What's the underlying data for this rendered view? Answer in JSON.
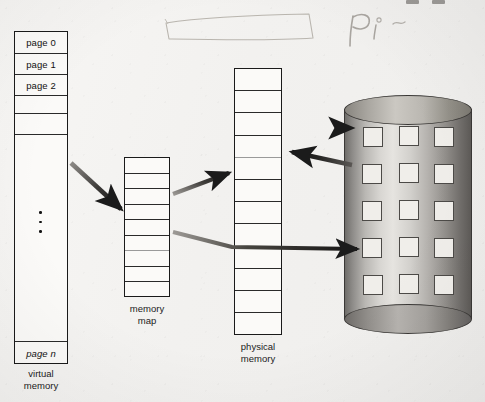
{
  "figure": {
    "background_color": "#f4f3f1",
    "ink_color": "#1a1a1a"
  },
  "virtual_memory": {
    "caption": "virtual\nmemory",
    "cells": [
      {
        "label": "page 0"
      },
      {
        "label": "page 1"
      },
      {
        "label": "page 2"
      },
      {
        "label": ""
      },
      {
        "label": ""
      },
      {
        "label": ""
      },
      {
        "label": "page n"
      }
    ],
    "ellipsis_dots": 3
  },
  "memory_map": {
    "caption": "memory\nmap",
    "cell_count": 9,
    "cells": [
      {
        "label": ""
      },
      {
        "label": ""
      },
      {
        "label": ""
      },
      {
        "label": ""
      },
      {
        "label": ""
      },
      {
        "label": ""
      },
      {
        "label": ""
      },
      {
        "label": ""
      },
      {
        "label": ""
      }
    ]
  },
  "physical_memory": {
    "caption": "physical\nmemory",
    "cell_count": 12,
    "cells": [
      {
        "label": ""
      },
      {
        "label": ""
      },
      {
        "label": ""
      },
      {
        "label": ""
      },
      {
        "label": ""
      },
      {
        "label": ""
      },
      {
        "label": ""
      },
      {
        "label": ""
      },
      {
        "label": ""
      },
      {
        "label": ""
      },
      {
        "label": ""
      },
      {
        "label": ""
      }
    ]
  },
  "disk": {
    "caption": "",
    "slot_rows": 5,
    "slot_columns": 3,
    "slot_color": "#f0eeea",
    "body_shade_color": "#8e8c89"
  },
  "arrows": [
    {
      "name": "virtual-memory-to-memory-map",
      "from": "virtual memory",
      "to": "memory map",
      "direction": "right-down"
    },
    {
      "name": "memory-map-to-physical-memory",
      "from": "memory map",
      "to": "physical memory",
      "direction": "right-up"
    },
    {
      "name": "memory-map-to-disk",
      "from": "memory map",
      "to": "disk",
      "direction": "right"
    },
    {
      "name": "physical-memory-to-disk",
      "from": "physical memory",
      "to": "disk",
      "direction": "right"
    },
    {
      "name": "disk-to-physical-memory",
      "from": "disk",
      "to": "physical memory",
      "direction": "left"
    }
  ],
  "annotations": {
    "pencil_note": "Pi",
    "pencil_rectangle": true
  }
}
